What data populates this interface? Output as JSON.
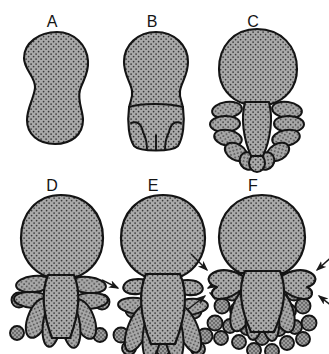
{
  "figure": {
    "background_color": "#ffffff",
    "outline_color": "#141414",
    "fill_color": "#a8a8a8",
    "stipple_color": "#3a3a3a",
    "arrow_color": "#1a1a1a",
    "panel_count": 6
  },
  "panels": [
    {
      "id": "A",
      "label": "A",
      "label_x": 52,
      "label_y": 14,
      "stage_description": "undivided pear-shaped body, smooth outline, no lobes",
      "lobes": 0,
      "spores": 0,
      "arrows": 0
    },
    {
      "id": "B",
      "label": "B",
      "label_x": 152,
      "label_y": 14,
      "stage_description": "bulb with shallow grooves marking incipient lobes at base",
      "lobes": 0,
      "grooves": 5,
      "spores": 0,
      "arrows": 0
    },
    {
      "id": "C",
      "label": "C",
      "label_x": 253,
      "label_y": 14,
      "stage_description": "short rounded lobes separated around central axis",
      "lobes": 12,
      "spores": 0,
      "arrows": 0
    },
    {
      "id": "D",
      "label": "D",
      "label_x": 52,
      "label_y": 178,
      "stage_description": "elongated finger-like lobes with a few detached round bodies",
      "lobes": 10,
      "spores": 6,
      "arrows": 0
    },
    {
      "id": "E",
      "label": "E",
      "label_x": 153,
      "label_y": 178,
      "stage_description": "longer lobes plus emerging lateral projections, more detached round bodies",
      "lobes": 9,
      "spores": 9,
      "arrows": 3
    },
    {
      "id": "F",
      "label": "F",
      "label_x": 253,
      "label_y": 178,
      "stage_description": "prominent lateral arms marked by arrows, numerous detached round bodies",
      "lobes": 7,
      "spores": 22,
      "arrows": 4
    }
  ],
  "arrow_annotations": [
    {
      "panel": "E",
      "position": "left",
      "points_to": "lateral projection"
    },
    {
      "panel": "E",
      "position": "right-upper",
      "points_to": "lateral projection"
    },
    {
      "panel": "E",
      "position": "right-lower",
      "points_to": "lateral projection"
    },
    {
      "panel": "F",
      "position": "left-upper",
      "points_to": "lateral arm"
    },
    {
      "panel": "F",
      "position": "left-lower",
      "points_to": "lateral arm"
    },
    {
      "panel": "F",
      "position": "right-upper",
      "points_to": "lateral arm"
    },
    {
      "panel": "F",
      "position": "right-lower",
      "points_to": "lateral arm"
    }
  ]
}
